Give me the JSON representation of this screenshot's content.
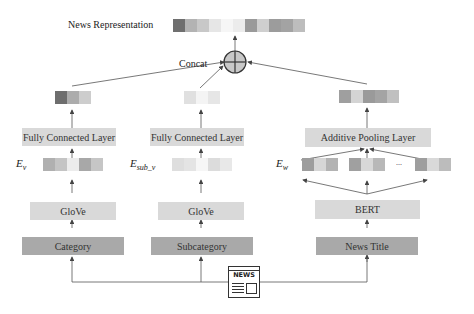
{
  "title": "News Representation",
  "concat_label": "Concat",
  "output_vector": [
    "#6f6f6f",
    "#b3b3b3",
    "#c8c8c8",
    "#e6e6e6",
    "#f6f6f6",
    "#ececec",
    "#9a9a9a",
    "#cfcfcf",
    "#9c9c9c",
    "#a3a3a3",
    "#bdbdbd"
  ],
  "branches": [
    {
      "name": "category",
      "input_label": "Category",
      "encoder_label": "GloVe",
      "embedding_label": "E_v",
      "embedding_vector": [
        "#b0b0b0",
        "#c4c4c4",
        "#ececec",
        "#a8a8a8",
        "#c6c6c6"
      ],
      "layer_label": "Fully Connected Layer",
      "output_vector": [
        "#6e6e6e",
        "#acacac",
        "#cdcdcd"
      ]
    },
    {
      "name": "subcategory",
      "input_label": "Subcategory",
      "encoder_label": "GloVe",
      "embedding_label": "E_sub_v",
      "embedding_vector": [
        "#dedede",
        "#e4e4e4",
        "#f6f6f6",
        "#dcdcdc",
        "#e8e8e8"
      ],
      "layer_label": "Fully Connected Layer",
      "output_vector": [
        "#e0e0e0",
        "#f4f4f4",
        "#e6e6e6"
      ]
    },
    {
      "name": "news-title",
      "input_label": "News Title",
      "encoder_label": "BERT",
      "embedding_label": "E_w",
      "token_vectors": [
        [
          "#9d9d9d",
          "#d6d6d6",
          "#b3b3b3"
        ],
        [
          "#a0a0a0",
          "#d8d8d8",
          "#b8b8b8"
        ],
        [
          "#9e9e9e",
          "#d9d9d9",
          "#bcbcbc"
        ]
      ],
      "ellipsis": "...",
      "layer_label": "Additive Pooling Layer",
      "output_vector": [
        "#9f9f9f",
        "#d4d4d4",
        "#9a9a9a",
        "#a4a4a4",
        "#c0c0c0"
      ]
    }
  ],
  "news_icon_text": "NEWS"
}
